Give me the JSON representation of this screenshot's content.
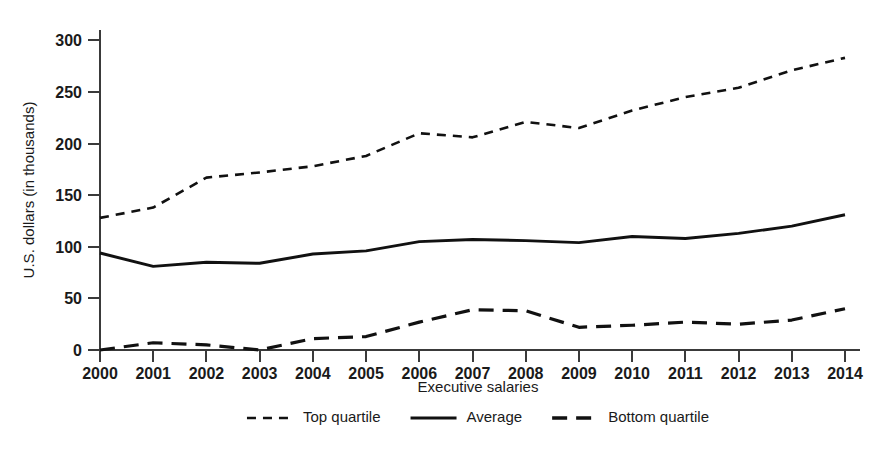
{
  "chart_data": {
    "type": "line",
    "title": "",
    "xlabel": "Executive salaries",
    "ylabel": "U.S. dollars (in thousands)",
    "x": [
      2000,
      2001,
      2002,
      2003,
      2004,
      2005,
      2006,
      2007,
      2008,
      2009,
      2010,
      2011,
      2012,
      2013,
      2014
    ],
    "categories": [
      "2000",
      "2001",
      "2002",
      "2003",
      "2004",
      "2005",
      "2006",
      "2007",
      "2008",
      "2009",
      "2010",
      "2011",
      "2012",
      "2013",
      "2014"
    ],
    "xlim": [
      2000,
      2014
    ],
    "ylim": [
      0,
      310
    ],
    "yticks": [
      0,
      50,
      100,
      150,
      200,
      250,
      300
    ],
    "ytick_labels": [
      "0",
      "50",
      "100",
      "150",
      "200",
      "250",
      "300"
    ],
    "grid": false,
    "legend_position": "bottom",
    "series": [
      {
        "name": "Top quartile",
        "style": "dashed-short",
        "color": "#111111",
        "values": [
          128,
          138,
          167,
          172,
          178,
          188,
          210,
          206,
          221,
          215,
          232,
          245,
          254,
          271,
          283
        ]
      },
      {
        "name": "Average",
        "style": "solid",
        "color": "#111111",
        "values": [
          94,
          81,
          85,
          84,
          93,
          96,
          105,
          107,
          106,
          104,
          110,
          108,
          113,
          120,
          131
        ]
      },
      {
        "name": "Bottom quartile",
        "style": "dashed-long",
        "color": "#111111",
        "values": [
          0,
          7,
          5,
          0,
          11,
          13,
          27,
          39,
          38,
          22,
          24,
          27,
          25,
          29,
          40
        ]
      }
    ]
  },
  "legend": {
    "items": [
      {
        "label": "Top quartile",
        "style": "dashed-short"
      },
      {
        "label": "Average",
        "style": "solid"
      },
      {
        "label": "Bottom quartile",
        "style": "dashed-long"
      }
    ]
  }
}
